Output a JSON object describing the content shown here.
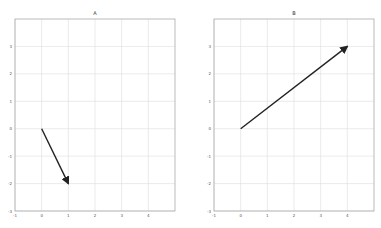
{
  "chart_data": [
    {
      "type": "line",
      "title": "A",
      "description": "vector arrow (quiver) plot",
      "xlabel": "",
      "ylabel": "",
      "xlim": [
        -1,
        5
      ],
      "ylim": [
        -3,
        4
      ],
      "xticks": [
        "-1",
        "0",
        "1",
        "2",
        "3",
        "4"
      ],
      "yticks": [
        "3",
        "2",
        "1",
        "0",
        "-1",
        "-2",
        "-3"
      ],
      "grid": true,
      "vectors": [
        {
          "x0": 0,
          "y0": 0,
          "x1": 1,
          "y1": -2,
          "color": "#222222"
        }
      ]
    },
    {
      "type": "line",
      "title": "B",
      "description": "vector arrow (quiver) plot",
      "xlabel": "",
      "ylabel": "",
      "xlim": [
        -1,
        5
      ],
      "ylim": [
        -3,
        4
      ],
      "xticks": [
        "-1",
        "0",
        "1",
        "2",
        "3",
        "4"
      ],
      "yticks": [
        "3",
        "2",
        "1",
        "0",
        "-1",
        "-2",
        "-3"
      ],
      "grid": true,
      "vectors": [
        {
          "x0": 0,
          "y0": 0,
          "x1": 4,
          "y1": 3,
          "color": "#222222"
        }
      ]
    }
  ],
  "panels": [
    {
      "title": "A"
    },
    {
      "title": "B"
    }
  ]
}
